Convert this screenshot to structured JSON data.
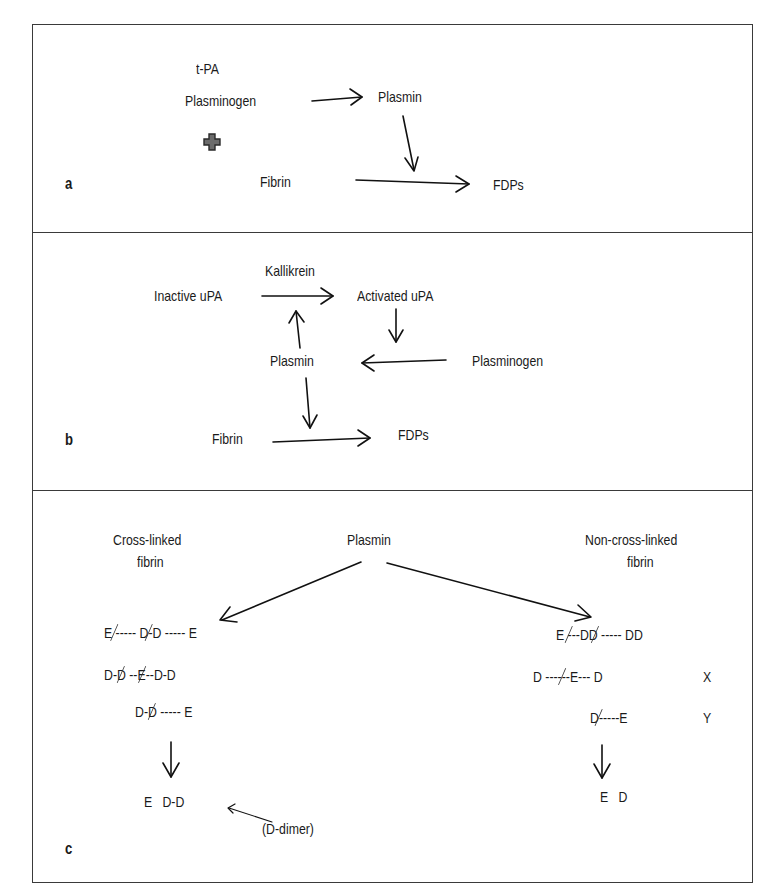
{
  "panels": {
    "a": {
      "label": "a",
      "nodes": {
        "tpa": "t-PA",
        "plasminogen": "Plasminogen",
        "plasmin": "Plasmin",
        "fibrin": "Fibrin",
        "fdps": "FDPs"
      },
      "plus_icon": "plus-icon"
    },
    "b": {
      "label": "b",
      "nodes": {
        "kallikrein": "Kallikrein",
        "inactive_upa": "Inactive uPA",
        "activated_upa": "Activated uPA",
        "plasmin": "Plasmin",
        "plasminogen": "Plasminogen",
        "fibrin": "Fibrin",
        "fdps": "FDPs"
      }
    },
    "c": {
      "label": "c",
      "plasmin": "Plasmin",
      "cross_linked": {
        "title_line1": "Cross-linked",
        "title_line2": "fibrin",
        "fragments": [
          [
            "E --",
            "--- D-D --",
            "--- E"
          ],
          [
            "D-D --",
            " E",
            "--D-D"
          ],
          [
            "D-D --",
            "--- E"
          ]
        ],
        "product": "E   D-D",
        "annotation": "(D-dimer)"
      },
      "non_cross_linked": {
        "title_line1": "Non-cross-linked",
        "title_line2": "fibrin",
        "fragments": [
          [
            "E ---",
            " DD --",
            "--- DD"
          ],
          [
            "D ------E---",
            " D"
          ],
          [
            "D--",
            "---E"
          ]
        ],
        "fragment_labels": [
          "X",
          "Y"
        ],
        "product": "E   D"
      }
    }
  },
  "colors": {
    "border": "#3a3a3a",
    "text": "#1a1a1a",
    "plus_fill": "#6b6b6b"
  }
}
